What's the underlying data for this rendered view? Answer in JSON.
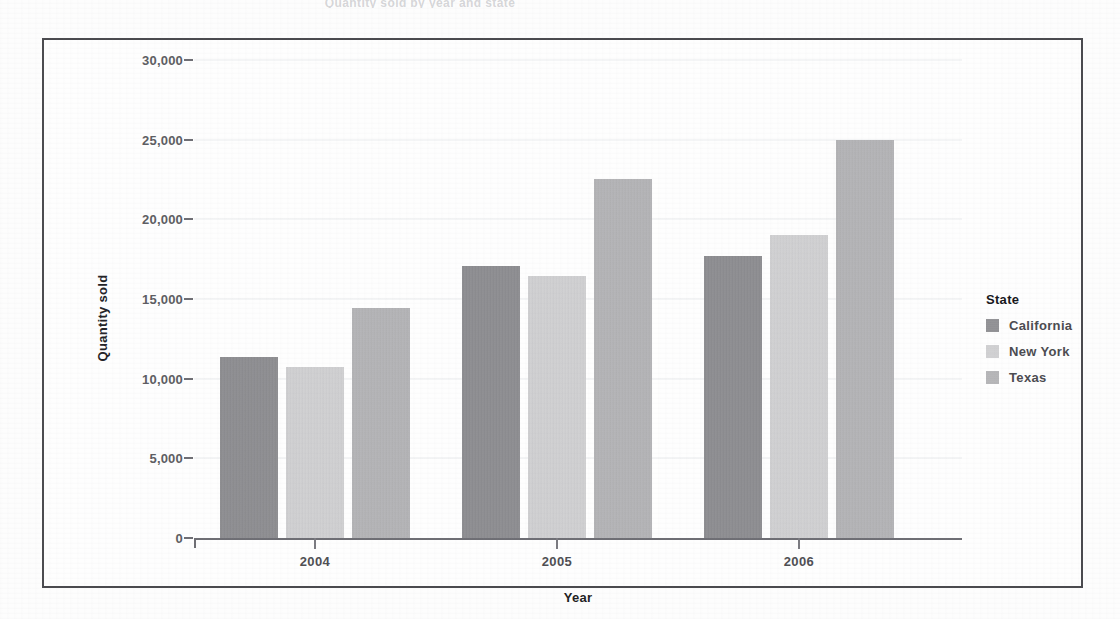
{
  "page": {
    "header_fragment": "Quantity sold by year and state"
  },
  "legend": {
    "title": "State",
    "position": "right",
    "entries": [
      {
        "label": "California",
        "color": "#8a8a8e"
      },
      {
        "label": "New York",
        "color": "#d3d3d5"
      },
      {
        "label": "Texas",
        "color": "#b4b4b7"
      }
    ]
  },
  "chart_data": {
    "type": "bar",
    "title": "Quantity sold by year and state",
    "xlabel": "Year",
    "ylabel": "Quantity sold",
    "categories": [
      "2004",
      "2005",
      "2006"
    ],
    "series": [
      {
        "name": "California",
        "color": "#8a8a8e",
        "values": [
          11350,
          17100,
          17700
        ]
      },
      {
        "name": "New York",
        "color": "#d3d3d5",
        "values": [
          10750,
          16450,
          19000
        ]
      },
      {
        "name": "Texas",
        "color": "#b4b4b7",
        "values": [
          14450,
          22550,
          25000
        ]
      }
    ],
    "ylim": [
      0,
      30000
    ],
    "ytick_values": [
      0,
      5000,
      10000,
      15000,
      20000,
      25000,
      30000
    ],
    "ytick_labels": [
      "0",
      "5,000",
      "10,000",
      "15,000",
      "20,000",
      "25,000",
      "30,000"
    ],
    "grid": true,
    "grouped": true
  }
}
